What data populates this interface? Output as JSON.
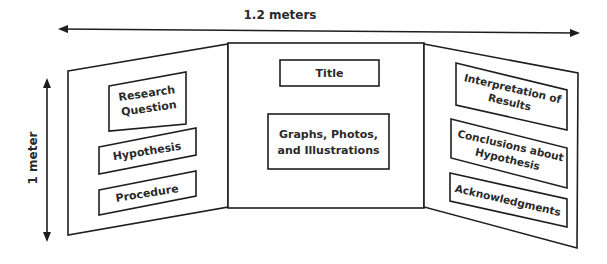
{
  "diagram": {
    "type": "trifold-display-board",
    "dimensions": {
      "width_label": "1.2 meters",
      "height_label": "1 meter"
    },
    "panels": {
      "left": {
        "sections": [
          {
            "label_line1": "Research",
            "label_line2": "Question"
          },
          {
            "label": "Hypothesis"
          },
          {
            "label": "Procedure"
          }
        ]
      },
      "center": {
        "sections": [
          {
            "label": "Title"
          },
          {
            "label_line1": "Graphs, Photos,",
            "label_line2": "and Illustrations"
          }
        ]
      },
      "right": {
        "sections": [
          {
            "label_line1": "Interpretation of",
            "label_line2": "Results"
          },
          {
            "label_line1": "Conclusions about",
            "label_line2": "Hypothesis"
          },
          {
            "label": "Acknowledgments"
          }
        ]
      }
    },
    "colors": {
      "stroke": "#1e1e1e",
      "text": "#2a2a2a",
      "background": "#ffffff"
    }
  }
}
